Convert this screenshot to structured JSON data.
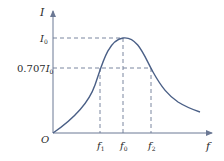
{
  "diagram": {
    "type": "resonance-curve",
    "colors": {
      "curve": "#4a5f86",
      "axis": "#6b7894",
      "dash": "#6b7894",
      "text": "#2a2a2a"
    },
    "axes": {
      "y_label": "I",
      "x_label": "f",
      "origin_label": "O"
    },
    "y_ticks": [
      {
        "label_main": "I",
        "label_sub": "0",
        "prefix": ""
      },
      {
        "label_main": "I",
        "label_sub": "0",
        "prefix": "0.707"
      }
    ],
    "x_ticks": [
      {
        "label_main": "f",
        "label_sub": "1"
      },
      {
        "label_main": "f",
        "label_sub": "0"
      },
      {
        "label_main": "f",
        "label_sub": "2"
      }
    ]
  }
}
